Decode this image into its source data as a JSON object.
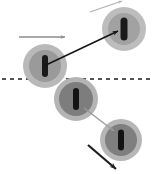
{
  "figure": {
    "type": "diagram",
    "title": "",
    "background_color": "#ffffff",
    "width": 155,
    "height": 174
  },
  "reference_line": {
    "label": "",
    "style": "dashed",
    "color": "#1a1a1a",
    "y": 79,
    "x_start": 2,
    "x_end": 152,
    "dash": "4 4",
    "width": 1.4
  },
  "spheres": [
    {
      "id": "sphere-1",
      "label": "",
      "cx": 45,
      "cy": 66,
      "outer_radius": 22,
      "inner_radius": 16,
      "outer_color": "#b9b9b9",
      "inner_color": "#9a9a9a",
      "marker_color": "#1a1a1a",
      "marker_width": 6,
      "marker_height": 22,
      "marker_tilt": 0
    },
    {
      "id": "sphere-2",
      "label": "",
      "cx": 124,
      "cy": 29,
      "outer_radius": 22,
      "inner_radius": 16,
      "outer_color": "#bdbdbd",
      "inner_color": "#a2a2a2",
      "marker_color": "#1a1a1a",
      "marker_width": 7,
      "marker_height": 23,
      "marker_tilt": 0
    },
    {
      "id": "sphere-3",
      "label": "",
      "cx": 76,
      "cy": 99,
      "outer_radius": 22,
      "inner_radius": 17,
      "outer_color": "#b4b4b4",
      "inner_color": "#7d7d7d",
      "marker_color": "#141414",
      "marker_width": 6,
      "marker_height": 22,
      "marker_tilt": 0
    },
    {
      "id": "sphere-4",
      "label": "",
      "cx": 121,
      "cy": 140,
      "outer_radius": 21,
      "inner_radius": 16,
      "outer_color": "#b6b6b6",
      "inner_color": "#7f7f7f",
      "marker_color": "#141414",
      "marker_width": 6,
      "marker_height": 21,
      "marker_tilt": 0
    }
  ],
  "arrows": [
    {
      "id": "arrow-top-faint",
      "label": "",
      "x1": 90,
      "y1": 12,
      "x2": 122,
      "y2": 1,
      "color": "#b0b0b0",
      "width": 1.2,
      "head_size": 4
    },
    {
      "id": "arrow-horizontal-left",
      "label": "",
      "x1": 19,
      "y1": 37,
      "x2": 65,
      "y2": 37,
      "color": "#8c8c8c",
      "width": 1.6,
      "head_size": 5
    },
    {
      "id": "arrow-connector-1-to-2",
      "label": "",
      "x1": 46,
      "y1": 65,
      "x2": 118,
      "y2": 31,
      "color": "#141414",
      "width": 1.5,
      "head_size": 6
    },
    {
      "id": "arrow-connector-3-to-4",
      "label": "",
      "x1": 84,
      "y1": 108,
      "x2": 114,
      "y2": 131,
      "color": "#9a9a9a",
      "width": 1.3,
      "head_size": 5
    },
    {
      "id": "arrow-bottom-exit",
      "label": "",
      "x1": 88,
      "y1": 145,
      "x2": 116,
      "y2": 169,
      "color": "#1f1f1f",
      "width": 2.2,
      "head_size": 7
    }
  ]
}
